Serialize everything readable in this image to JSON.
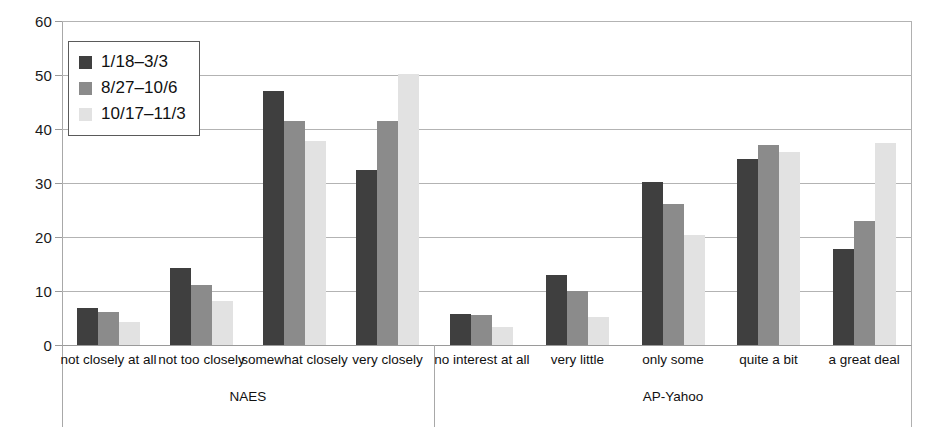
{
  "chart_data": {
    "type": "bar",
    "title": "",
    "subtitle": "",
    "xlabel": "",
    "ylabel": "",
    "ylim": [
      0,
      60
    ],
    "yticks": [
      "0",
      "10",
      "20",
      "30",
      "40",
      "50",
      "60"
    ],
    "grid": true,
    "legend_position": "top-left",
    "categories": [
      "not closely at all",
      "not too closely",
      "somewhat closely",
      "very closely",
      "no interest at all",
      "very little",
      "only some",
      "quite a bit",
      "a great deal"
    ],
    "groups": [
      {
        "name": "NAES",
        "categories": [
          "not closely at all",
          "not too closely",
          "somewhat closely",
          "very closely"
        ]
      },
      {
        "name": "AP-Yahoo",
        "categories": [
          "no interest at all",
          "very little",
          "only some",
          "quite a bit",
          "a great deal"
        ]
      }
    ],
    "series": [
      {
        "name": "1/18–3/3",
        "color": "#3f3f3f",
        "values": [
          6.8,
          14.3,
          47.0,
          32.5,
          5.8,
          12.9,
          30.2,
          34.5,
          17.8
        ]
      },
      {
        "name": "8/27–10/6",
        "color": "#8b8b8b",
        "values": [
          6.2,
          11.2,
          41.4,
          41.5,
          5.6,
          10.0,
          26.1,
          37.0,
          23.0
        ]
      },
      {
        "name": "10/17–11/3",
        "color": "#e2e2e2",
        "values": [
          4.3,
          8.1,
          37.8,
          50.2,
          3.3,
          5.2,
          20.3,
          35.8,
          37.5
        ]
      }
    ]
  },
  "legend": {
    "entries": [
      {
        "label": "1/18–3/3",
        "color": "#3f3f3f"
      },
      {
        "label": "8/27–10/6",
        "color": "#8b8b8b"
      },
      {
        "label": "10/17–11/3",
        "color": "#e2e2e2"
      }
    ]
  },
  "axis": {
    "y_ticks": [
      "60",
      "50",
      "40",
      "30",
      "20",
      "10",
      "0"
    ]
  }
}
